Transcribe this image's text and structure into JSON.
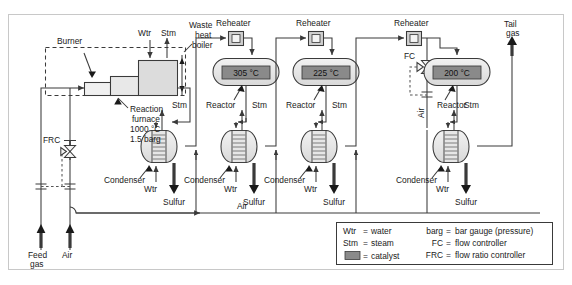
{
  "diagram": {
    "frame_border_color": "#c8c8c8",
    "line_color": "#3a3a3a",
    "vessel_fill": "#e8e8e8",
    "catalyst_fill": "#8a8a8a",
    "reheater_fill": "#d0d0d0"
  },
  "labels": {
    "burner": "Burner",
    "wtr_top": "Wtr",
    "stm_top": "Stm",
    "waste_heat_boiler": [
      "Waste",
      "heat",
      "boiler"
    ],
    "reaction_furnace": [
      "Reaction",
      "furnace",
      "1000 °C",
      "1.5 barg"
    ],
    "frc": "FRC",
    "fc": "FC",
    "feed_gas": [
      "Feed",
      "gas"
    ],
    "air_inlet": "Air",
    "air_header": "Air",
    "air_vertical": "Air",
    "tail_gas": [
      "Tail",
      "gas"
    ],
    "reheater": "Reheater",
    "reactor": "Reactor",
    "condenser": "Condenser",
    "stm": "Stm",
    "wtr": "Wtr",
    "sulfur": "Sulfur"
  },
  "reactors": [
    {
      "id": "reactor-1",
      "temperature": "305 °C"
    },
    {
      "id": "reactor-2",
      "temperature": "225 °C"
    },
    {
      "id": "reactor-3",
      "temperature": "200 °C"
    }
  ],
  "reheaters": [
    {
      "id": "reheater-1",
      "label": "Reheater"
    },
    {
      "id": "reheater-2",
      "label": "Reheater"
    },
    {
      "id": "reheater-3",
      "label": "Reheater"
    }
  ],
  "condensers": [
    {
      "id": "condenser-1",
      "label": "Condenser",
      "water": "Wtr",
      "steam": "Stm",
      "product": "Sulfur"
    },
    {
      "id": "condenser-2",
      "label": "Condenser",
      "water": "Wtr",
      "steam": "Stm",
      "product": "Sulfur"
    },
    {
      "id": "condenser-3",
      "label": "Condenser",
      "water": "Wtr",
      "steam": "Stm",
      "product": "Sulfur"
    },
    {
      "id": "condenser-4",
      "label": "Condenser",
      "water": "Wtr",
      "steam": "Stm",
      "product": "Sulfur"
    }
  ],
  "legend": {
    "left": [
      {
        "term": "Wtr",
        "eq": "=",
        "def": "water"
      },
      {
        "term": "Stm",
        "eq": "=",
        "def": "steam"
      },
      {
        "term": "swatch",
        "eq": "=",
        "def": "catalyst"
      }
    ],
    "right": [
      {
        "term": "barg",
        "eq": "=",
        "def": "bar gauge (pressure)"
      },
      {
        "term": "FC",
        "eq": "=",
        "def": "flow controller"
      },
      {
        "term": "FRC",
        "eq": "=",
        "def": "flow ratio controller"
      }
    ]
  }
}
